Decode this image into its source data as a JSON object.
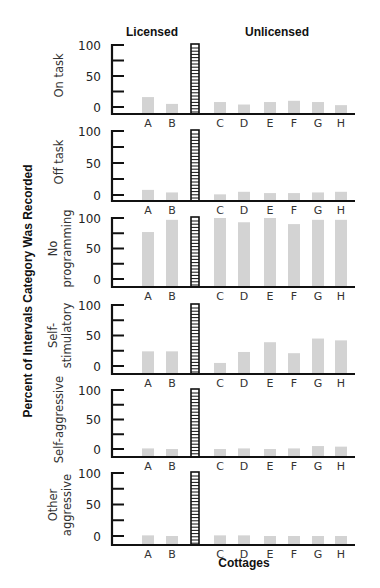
{
  "chart_data": {
    "type": "bar",
    "title": "",
    "xlabel": "Cottages",
    "ylabel": "Percent of Intervals Category Was Recorded",
    "ylim": [
      0,
      100
    ],
    "yticks": [
      0,
      50,
      100
    ],
    "minor_ticks": [
      0,
      25,
      50,
      75,
      100
    ],
    "grid": false,
    "legend": null,
    "groups": [
      {
        "name": "Licensed",
        "categories": [
          "A",
          "B"
        ]
      },
      {
        "name": "Unlicensed",
        "categories": [
          "C",
          "D",
          "E",
          "F",
          "G",
          "H"
        ]
      }
    ],
    "categories": [
      "A",
      "B",
      "C",
      "D",
      "E",
      "F",
      "G",
      "H"
    ],
    "separator": "hatched vertical bar dividing Licensed and Unlicensed cottages",
    "bar_color": "#d3d3d3",
    "panels": [
      {
        "name": "On task",
        "label_lines": [
          "On task"
        ],
        "values": [
          16,
          5,
          8,
          4,
          8,
          10,
          8,
          3
        ]
      },
      {
        "name": "Off task",
        "label_lines": [
          "Off task"
        ],
        "values": [
          8,
          4,
          1,
          5,
          3,
          3,
          4,
          5
        ]
      },
      {
        "name": "No programming",
        "label_lines": [
          "No",
          "programming"
        ],
        "values": [
          77,
          97,
          100,
          93,
          100,
          90,
          97,
          97
        ]
      },
      {
        "name": "Self-stimulatory",
        "label_lines": [
          "Self-",
          "stimulatory"
        ],
        "values": [
          24,
          24,
          5,
          23,
          39,
          21,
          45,
          42
        ]
      },
      {
        "name": "Self-aggressive",
        "label_lines": [
          "Self-aggressive"
        ],
        "values": [
          1,
          0,
          0,
          1,
          0,
          1,
          5,
          4
        ]
      },
      {
        "name": "Other aggressive",
        "label_lines": [
          "Other",
          "aggressive"
        ],
        "values": [
          1,
          0,
          1,
          1,
          0,
          0,
          0,
          0
        ]
      }
    ]
  },
  "layout_panels": [
    {
      "top": 45,
      "zero": 107,
      "base": 114
    },
    {
      "top": 131,
      "zero": 195,
      "base": 201
    },
    {
      "top": 218,
      "zero": 279,
      "base": 287
    },
    {
      "top": 305,
      "zero": 366,
      "base": 374
    },
    {
      "top": 390,
      "zero": 449,
      "base": 457
    },
    {
      "top": 473,
      "zero": 536,
      "base": 545
    }
  ]
}
